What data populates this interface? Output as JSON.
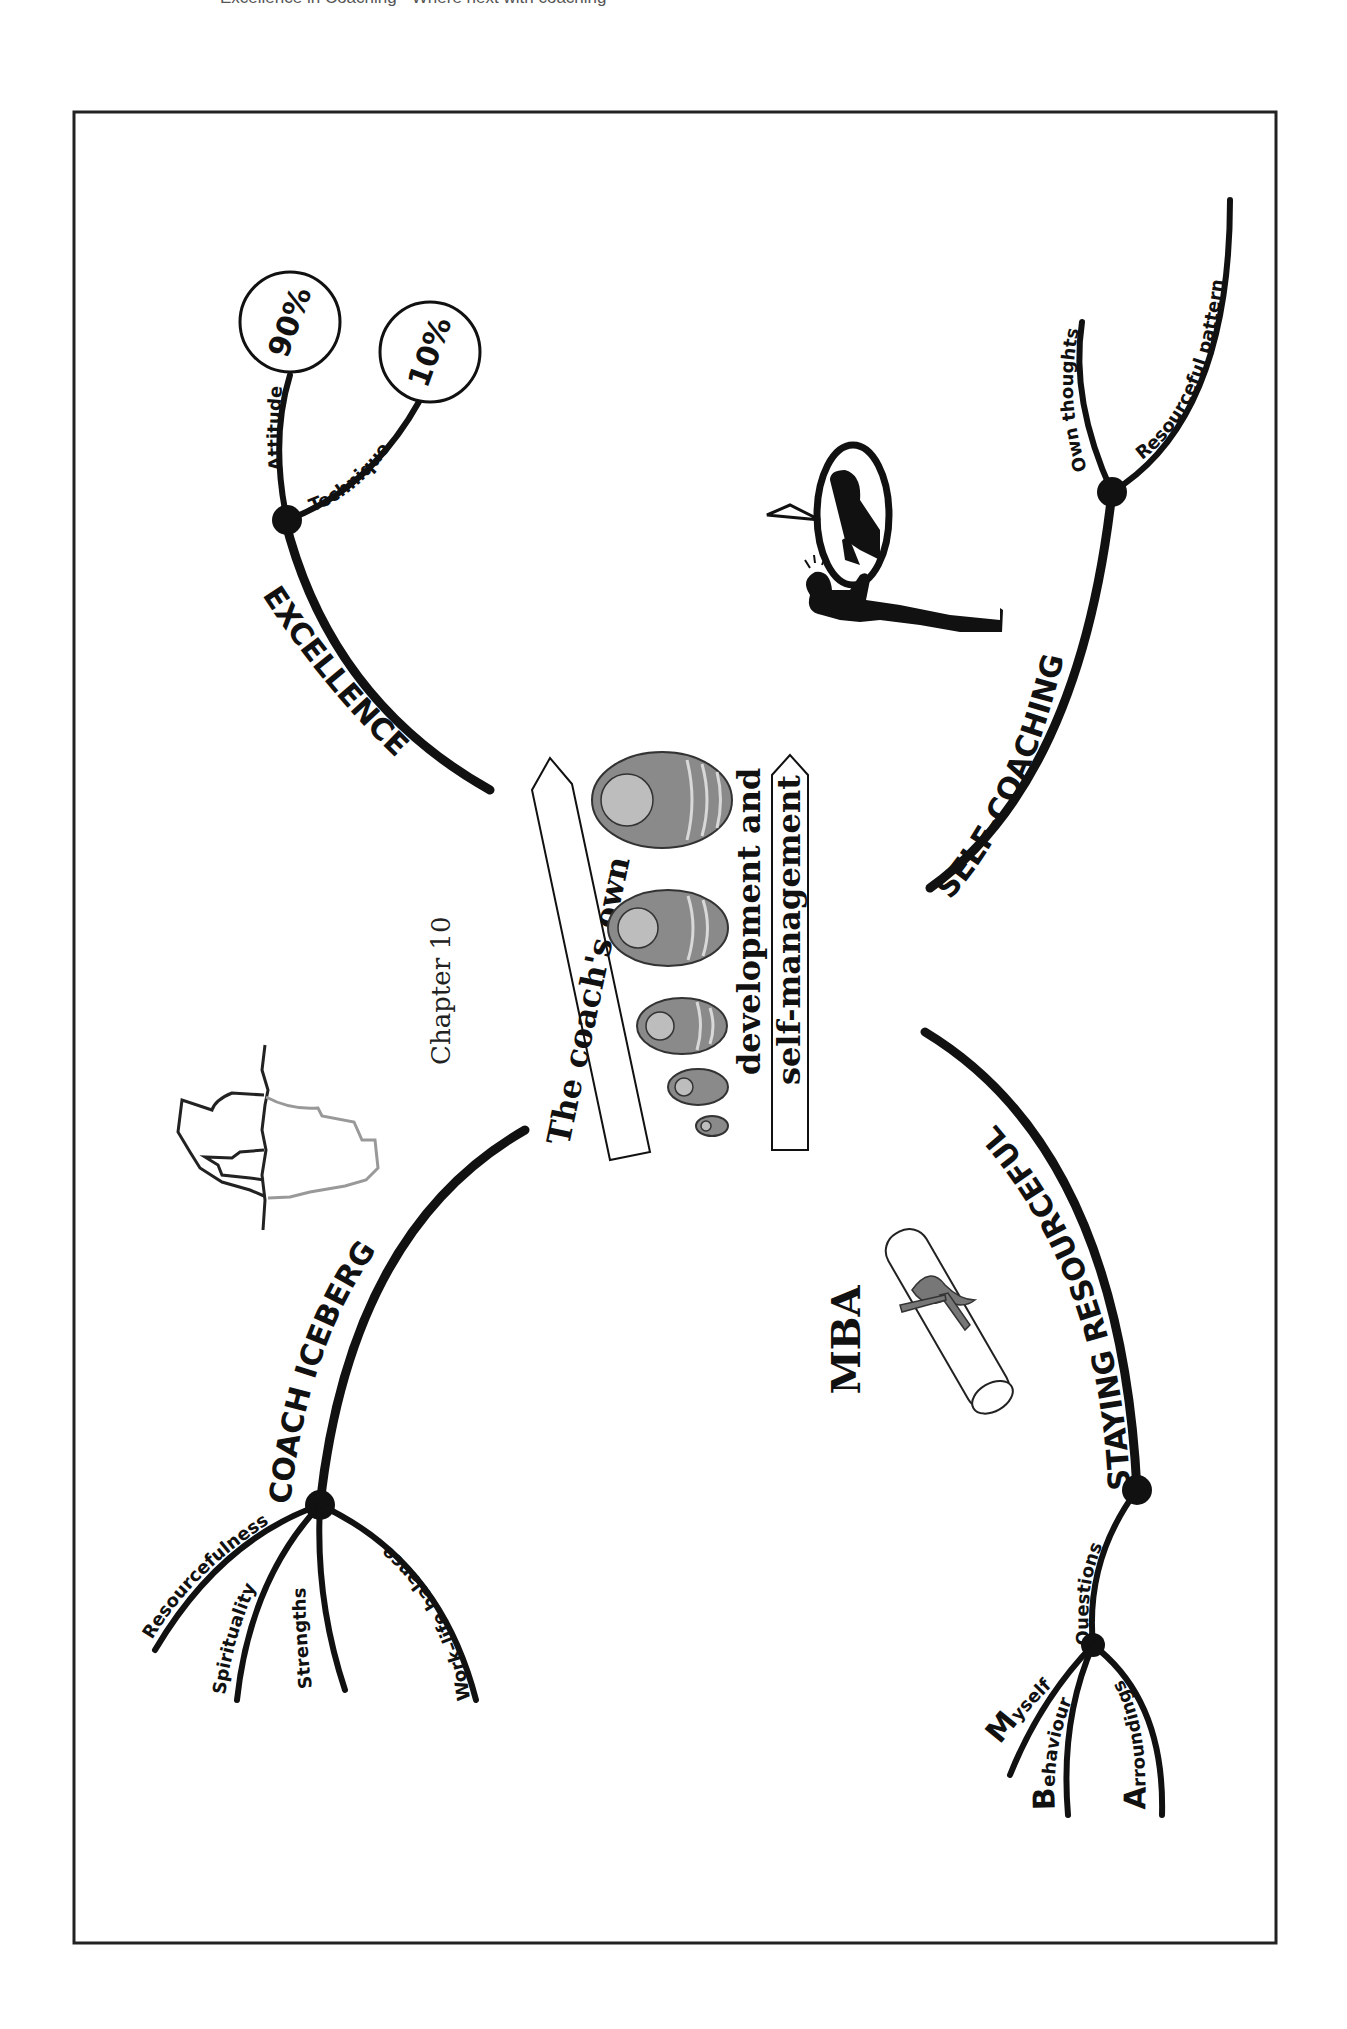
{
  "page": {
    "running_head": "Excellence in Coaching · Where next with coaching",
    "chapter_label": "Chapter 10",
    "center_title": {
      "line1": "The coach's own",
      "line2": "development and",
      "line3": "self-management"
    }
  },
  "branches": {
    "excellence": {
      "label": "EXCELLENCE",
      "children": [
        {
          "label": "Attitude",
          "value": "90%"
        },
        {
          "label": "Technique",
          "value": "10%"
        }
      ]
    },
    "self_coaching": {
      "label": "SELF-COACHING",
      "children": [
        {
          "label": "Own thoughts"
        },
        {
          "label": "Resourceful pattern"
        }
      ]
    },
    "coach_iceberg": {
      "label": "COACH ICEBERG",
      "children": [
        {
          "label": "Resourcefulness"
        },
        {
          "label": "Spirituality"
        },
        {
          "label": "Strengths"
        },
        {
          "label": "Work–life balance"
        }
      ]
    },
    "staying_resourceful": {
      "label": "STAYING RESOURCEFUL",
      "children": [
        {
          "label": "Questions",
          "children": [
            {
              "initial": "M",
              "rest": "yself"
            },
            {
              "initial": "B",
              "rest": "ehaviour"
            },
            {
              "initial": "A",
              "rest": "rroundings"
            }
          ]
        }
      ]
    }
  },
  "illustrations": {
    "mba_label": "MBA",
    "icons": [
      "iceberg-icon",
      "matryoshka-dolls-icon",
      "diploma-scroll-icon",
      "self-talk-silhouette-icon"
    ]
  },
  "colors": {
    "ink": "#111111",
    "iceberg_underwater": "#999999",
    "paper": "#ffffff"
  }
}
